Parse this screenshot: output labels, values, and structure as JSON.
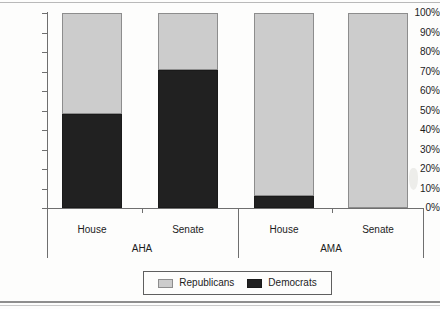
{
  "chart_data": {
    "type": "bar",
    "subtype": "100% stacked bar",
    "title": "",
    "xlabel": "",
    "ylabel": "",
    "ylim": [
      0,
      100
    ],
    "grid": false,
    "legend_position": "bottom-center",
    "groups": [
      "AHA",
      "AMA"
    ],
    "categories": [
      "House",
      "Senate",
      "House",
      "Senate"
    ],
    "category_groups": [
      "AHA",
      "AHA",
      "AMA",
      "AMA"
    ],
    "series": [
      {
        "name": "Republicans",
        "color": "#cccccc",
        "values": [
          52,
          29,
          94,
          100
        ]
      },
      {
        "name": "Democrats",
        "color": "#212121",
        "values": [
          48,
          71,
          6,
          0
        ]
      }
    ],
    "ytick_labels": [
      "100%",
      "90%",
      "80%",
      "70%",
      "60%",
      "50%",
      "40%",
      "30%",
      "20%",
      "10%",
      "0%"
    ],
    "ytick_values": [
      100,
      90,
      80,
      70,
      60,
      50,
      40,
      30,
      20,
      10,
      0
    ]
  },
  "legend": {
    "items": [
      {
        "label": "Republicans",
        "color": "#cccccc"
      },
      {
        "label": "Democrats",
        "color": "#212121"
      }
    ]
  },
  "axis": {
    "y_ticks": [
      {
        "label": "100%",
        "value": 100
      },
      {
        "label": "90%",
        "value": 90
      },
      {
        "label": "80%",
        "value": 80
      },
      {
        "label": "70%",
        "value": 70
      },
      {
        "label": "60%",
        "value": 60
      },
      {
        "label": "50%",
        "value": 50
      },
      {
        "label": "40%",
        "value": 40
      },
      {
        "label": "30%",
        "value": 30
      },
      {
        "label": "20%",
        "value": 20
      },
      {
        "label": "10%",
        "value": 10
      },
      {
        "label": "0%",
        "value": 0
      }
    ],
    "categories": [
      {
        "label": "House"
      },
      {
        "label": "Senate"
      },
      {
        "label": "House"
      },
      {
        "label": "Senate"
      }
    ],
    "groups": [
      {
        "label": "AHA"
      },
      {
        "label": "AMA"
      }
    ]
  }
}
